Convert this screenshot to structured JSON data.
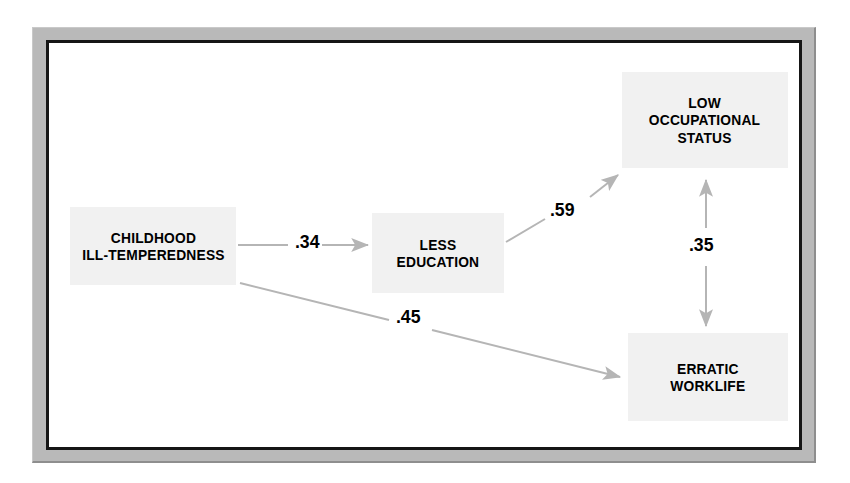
{
  "figure": {
    "type": "path-diagram",
    "frame": {
      "border_color": "#161616",
      "bevel_color": "#b9b9b9",
      "background": "#ffffff"
    },
    "node_fill": "#f1f1f1",
    "connector_color": "#b5b5b5"
  },
  "nodes": [
    {
      "id": "childhood",
      "label": "CHILDHOOD\nILL-TEMPEREDNESS"
    },
    {
      "id": "education",
      "label": "LESS\nEDUCATION"
    },
    {
      "id": "status",
      "label": "LOW\nOCCUPATIONAL\nSTATUS"
    },
    {
      "id": "worklife",
      "label": "ERRATIC\nWORKLIFE"
    }
  ],
  "paths": [
    {
      "id": "p34",
      "from": "childhood",
      "to": "education",
      "coefficient": ".34",
      "direction": "one-way"
    },
    {
      "id": "p59",
      "from": "education",
      "to": "status",
      "coefficient": ".59",
      "direction": "one-way"
    },
    {
      "id": "p45",
      "from": "childhood",
      "to": "worklife",
      "coefficient": ".45",
      "direction": "one-way"
    },
    {
      "id": "p35",
      "from": "status",
      "to": "worklife",
      "coefficient": ".35",
      "direction": "two-way"
    }
  ]
}
